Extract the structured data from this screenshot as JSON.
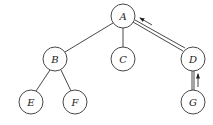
{
  "diagram": {
    "type": "tree",
    "nodes": [
      {
        "id": "A",
        "label": "A",
        "x": 123,
        "y": 16
      },
      {
        "id": "B",
        "label": "B",
        "x": 55,
        "y": 59
      },
      {
        "id": "C",
        "label": "C",
        "x": 123,
        "y": 59
      },
      {
        "id": "D",
        "label": "D",
        "x": 193,
        "y": 59
      },
      {
        "id": "E",
        "label": "E",
        "x": 31,
        "y": 102
      },
      {
        "id": "F",
        "label": "F",
        "x": 75,
        "y": 102
      },
      {
        "id": "G",
        "label": "G",
        "x": 193,
        "y": 102
      }
    ],
    "edges": [
      {
        "from": "A",
        "to": "B",
        "style": "single"
      },
      {
        "from": "A",
        "to": "C",
        "style": "single"
      },
      {
        "from": "A",
        "to": "D",
        "style": "double"
      },
      {
        "from": "B",
        "to": "E",
        "style": "single"
      },
      {
        "from": "B",
        "to": "F",
        "style": "single"
      },
      {
        "from": "D",
        "to": "G",
        "style": "double"
      }
    ],
    "arrows": [
      {
        "from": "D",
        "to": "A",
        "description": "path pointer upward"
      },
      {
        "from": "G",
        "to": "D",
        "description": "path pointer upward"
      }
    ]
  }
}
